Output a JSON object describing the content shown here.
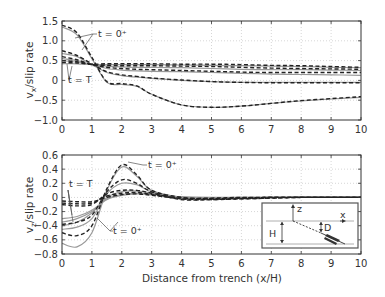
{
  "chart_data": [
    {
      "type": "line",
      "panel": "top",
      "title": "",
      "xlabel": "",
      "ylabel": "v_x/slip rate",
      "ylabel_main": "v",
      "ylabel_sub": "x",
      "ylabel_rest": "/slip rate",
      "xlim": [
        0,
        10
      ],
      "ylim": [
        -1.0,
        1.5
      ],
      "xticks": [
        "0",
        "1",
        "2",
        "3",
        "4",
        "5",
        "6",
        "7",
        "8",
        "9",
        "10"
      ],
      "yticks": [
        "1.5",
        "1.0",
        "0.5",
        "0",
        "-0.5",
        "-1.0"
      ],
      "yticks_values": [
        1.5,
        1.0,
        0.5,
        0,
        -0.5,
        -1.0
      ],
      "grid": true,
      "annotations": [
        {
          "text": "t = 0⁺",
          "x": 2.6,
          "y": 1.18
        },
        {
          "text": "t = T",
          "x": 0.3,
          "y": 0.0
        }
      ],
      "x": [
        0,
        0.5,
        1,
        1.5,
        2,
        2.5,
        3,
        4,
        5,
        6,
        7,
        8,
        9,
        10
      ],
      "series": [
        {
          "name": "t = 0+ (solid)",
          "style": "solid",
          "values": [
            1.35,
            1.15,
            0.55,
            -0.05,
            -0.1,
            -0.15,
            -0.35,
            -0.62,
            -0.68,
            -0.65,
            -0.58,
            -0.52,
            -0.47,
            -0.43
          ]
        },
        {
          "name": "t = 0+ (dashed)",
          "style": "dashed",
          "values": [
            1.4,
            1.2,
            0.58,
            -0.03,
            -0.08,
            -0.14,
            -0.35,
            -0.62,
            -0.68,
            -0.65,
            -0.58,
            -0.51,
            -0.46,
            -0.41
          ]
        },
        {
          "name": "t2 solid",
          "style": "solid",
          "values": [
            0.68,
            0.6,
            0.4,
            0.2,
            0.12,
            0.08,
            0.05,
            0.0,
            -0.03,
            -0.05,
            -0.05,
            -0.05,
            -0.05,
            -0.05
          ]
        },
        {
          "name": "t2 dashed",
          "style": "dashed",
          "values": [
            0.75,
            0.63,
            0.42,
            0.22,
            0.14,
            0.1,
            0.06,
            0.01,
            -0.03,
            -0.05,
            -0.06,
            -0.06,
            -0.06,
            -0.06
          ]
        },
        {
          "name": "t3 solid",
          "style": "solid",
          "values": [
            0.55,
            0.5,
            0.4,
            0.3,
            0.26,
            0.24,
            0.23,
            0.22,
            0.2,
            0.18,
            0.16,
            0.15,
            0.14,
            0.13
          ]
        },
        {
          "name": "t3 dashed",
          "style": "dashed",
          "values": [
            0.6,
            0.52,
            0.4,
            0.33,
            0.3,
            0.28,
            0.27,
            0.25,
            0.23,
            0.21,
            0.2,
            0.2,
            0.2,
            0.2
          ]
        },
        {
          "name": "t4 solid",
          "style": "solid",
          "values": [
            0.5,
            0.46,
            0.4,
            0.36,
            0.34,
            0.33,
            0.33,
            0.32,
            0.3,
            0.28,
            0.27,
            0.27,
            0.26,
            0.25
          ]
        },
        {
          "name": "t4 dashed",
          "style": "dashed",
          "values": [
            0.5,
            0.47,
            0.4,
            0.38,
            0.37,
            0.37,
            0.37,
            0.36,
            0.35,
            0.33,
            0.31,
            0.3,
            0.29,
            0.28
          ]
        },
        {
          "name": "t = T (solid)",
          "style": "solid",
          "values": [
            0.42,
            0.42,
            0.4,
            0.4,
            0.4,
            0.4,
            0.4,
            0.39,
            0.38,
            0.37,
            0.36,
            0.35,
            0.33,
            0.32
          ]
        },
        {
          "name": "t = T (dashed)",
          "style": "dashed",
          "values": [
            0.45,
            0.44,
            0.41,
            0.42,
            0.42,
            0.42,
            0.42,
            0.41,
            0.41,
            0.4,
            0.38,
            0.37,
            0.35,
            0.33
          ]
        }
      ]
    },
    {
      "type": "line",
      "panel": "bottom",
      "title": "",
      "xlabel": "Distance from trench (x/H)",
      "ylabel": "v_z/slip rate",
      "ylabel_main": "v",
      "ylabel_sub": "z",
      "ylabel_rest": "/slip rate",
      "xlim": [
        0,
        10
      ],
      "ylim": [
        -0.8,
        0.6
      ],
      "xticks": [
        "0",
        "1",
        "2",
        "3",
        "4",
        "5",
        "6",
        "7",
        "8",
        "9",
        "10"
      ],
      "yticks": [
        "0.6",
        "0.4",
        "0.2",
        "0",
        "-0.2",
        "-0.4",
        "-0.6",
        "-0.8"
      ],
      "yticks_values": [
        0.6,
        0.4,
        0.2,
        0,
        -0.2,
        -0.4,
        -0.6,
        -0.8
      ],
      "grid": true,
      "annotations": [
        {
          "text": "t = 0⁺",
          "x": 2.9,
          "y": 0.46
        },
        {
          "text": "t = T",
          "x": 0.2,
          "y": 0.2
        },
        {
          "text": "t = 0⁺",
          "x": 1.7,
          "y": -0.5
        }
      ],
      "inset": {
        "labels": [
          "z",
          "x",
          "H",
          "D"
        ],
        "description": "cross-section with surface line, dipping dashed fault from trench, locking depth D, plate thickness H"
      },
      "x": [
        0,
        0.5,
        1,
        1.5,
        2,
        2.5,
        3,
        4,
        5,
        6,
        7,
        8,
        9,
        10
      ],
      "series": [
        {
          "name": "t = 0+ (solid)",
          "style": "solid",
          "values": [
            -0.65,
            -0.7,
            -0.5,
            0.1,
            0.43,
            0.3,
            0.1,
            0.0,
            -0.01,
            -0.01,
            0.0,
            0.0,
            0.0,
            0.0
          ]
        },
        {
          "name": "t = 0+ (dashed)",
          "style": "dashed",
          "values": [
            -0.5,
            -0.54,
            -0.4,
            0.12,
            0.46,
            0.32,
            0.1,
            0.0,
            -0.02,
            -0.01,
            0.0,
            0.0,
            0.0,
            0.0
          ]
        },
        {
          "name": "t2 solid",
          "style": "solid",
          "values": [
            -0.45,
            -0.42,
            -0.3,
            0.05,
            0.2,
            0.18,
            0.08,
            0.0,
            -0.02,
            -0.01,
            0.0,
            0.0,
            0.0,
            0.0
          ]
        },
        {
          "name": "t2 dashed",
          "style": "dashed",
          "values": [
            -0.38,
            -0.35,
            -0.25,
            0.08,
            0.25,
            0.2,
            0.08,
            -0.02,
            -0.03,
            -0.02,
            -0.01,
            0.0,
            0.0,
            0.0
          ]
        },
        {
          "name": "t3 solid",
          "style": "solid",
          "values": [
            -0.4,
            -0.35,
            -0.22,
            0.0,
            0.08,
            0.09,
            0.06,
            0.0,
            -0.01,
            -0.01,
            0.0,
            0.0,
            0.0,
            0.0
          ]
        },
        {
          "name": "t3 dashed",
          "style": "dashed",
          "values": [
            -0.1,
            -0.12,
            -0.1,
            0.05,
            0.1,
            0.1,
            0.06,
            -0.03,
            -0.03,
            -0.02,
            -0.01,
            0.0,
            0.0,
            0.0
          ]
        },
        {
          "name": "t4 solid",
          "style": "solid",
          "values": [
            -0.35,
            -0.3,
            -0.2,
            -0.02,
            0.04,
            0.06,
            0.05,
            0.0,
            -0.01,
            0.0,
            0.0,
            0.0,
            0.0,
            0.0
          ]
        },
        {
          "name": "t4 dashed",
          "style": "dashed",
          "values": [
            -0.08,
            -0.09,
            -0.08,
            0.02,
            0.06,
            0.07,
            0.04,
            -0.02,
            -0.02,
            -0.01,
            0.0,
            0.0,
            0.0,
            0.0
          ]
        },
        {
          "name": "t = T (solid)",
          "style": "solid",
          "values": [
            -0.3,
            -0.27,
            -0.18,
            -0.03,
            0.03,
            0.05,
            0.04,
            0.01,
            0.0,
            0.0,
            0.0,
            0.0,
            0.0,
            0.0
          ]
        },
        {
          "name": "t = T (dashed)",
          "style": "dashed",
          "values": [
            -0.05,
            -0.06,
            -0.06,
            0.0,
            0.04,
            0.05,
            0.03,
            -0.01,
            -0.01,
            0.0,
            0.0,
            0.0,
            0.0,
            0.0
          ]
        }
      ]
    }
  ],
  "colors": {
    "axis": "#333333",
    "grid": "#bbbbbb",
    "solid_line": "#999999",
    "dashed_line": "#222222"
  }
}
